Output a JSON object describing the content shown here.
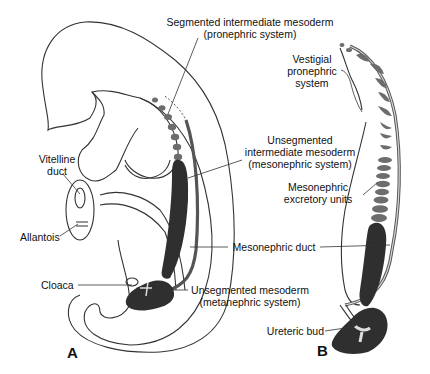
{
  "figure": {
    "panels": [
      {
        "id": "A",
        "label": "A"
      },
      {
        "id": "B",
        "label": "B"
      }
    ],
    "labels": {
      "segmented_intermediate": [
        "Segmented intermediate mesoderm",
        "(pronephric system)"
      ],
      "vestigial_pronephric": [
        "Vestigial",
        "pronephric",
        "system"
      ],
      "unsegmented_intermediate": [
        "Unsegmented",
        "intermediate mesoderm",
        "(mesonephric system)"
      ],
      "vitelline_duct": [
        "Vitelline",
        "duct"
      ],
      "allantois": [
        "Allantois"
      ],
      "mesonephric_excretory": [
        "Mesonephric",
        "excretory units"
      ],
      "mesonephric_duct": [
        "Mesonephric duct"
      ],
      "cloaca": [
        "Cloaca"
      ],
      "unsegmented_mesoderm": [
        "Unsegmented mesoderm",
        "(metanephric system)"
      ],
      "ureteric_bud": [
        "Ureteric bud"
      ]
    },
    "colors": {
      "outline": "#333333",
      "dark_tissue": "#2f2f2f",
      "segment_gray": "#6d6d6d"
    }
  }
}
